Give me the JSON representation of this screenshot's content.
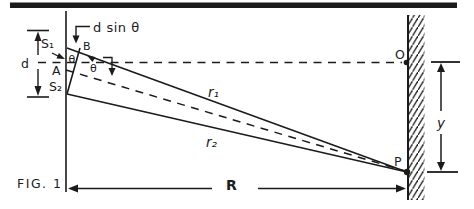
{
  "figure": {
    "caption": "FIG. 1",
    "colors": {
      "ink": "#1b1b1b",
      "background": "#ffffff"
    },
    "labels": {
      "path_difference": "d sin θ",
      "slit_top": "S₁",
      "slit_bottom": "S₂",
      "slit_midpoint": "A",
      "point_b": "B",
      "slit_separation": "d",
      "theta_slit": "θ",
      "theta_axis": "θ",
      "ray_top": "r₁",
      "ray_bottom": "r₂",
      "screen_center": "O",
      "screen_point": "P",
      "screen_distance": "R",
      "fringe_displacement": "y"
    }
  }
}
